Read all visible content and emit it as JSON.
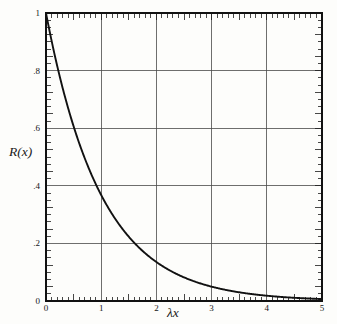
{
  "figure": {
    "name": "reliability-exponential-decay-plot",
    "background_color": "#fdfdfb",
    "line_color": "#111111",
    "grid_color": "#4a4a4a",
    "axis_color": "#111111"
  },
  "chart_data": {
    "type": "line",
    "title": "",
    "subtitle": "",
    "xlabel": "λx",
    "ylabel": "R(x)",
    "xlim": [
      0,
      5
    ],
    "ylim": [
      0,
      1
    ],
    "grid": true,
    "legend": null,
    "x_ticks": [
      0,
      1,
      2,
      3,
      4,
      5
    ],
    "x_tick_labels": [
      "0",
      "1",
      "2",
      "3",
      "4",
      "5"
    ],
    "y_ticks": [
      0,
      0.2,
      0.4,
      0.6,
      0.8,
      1
    ],
    "y_tick_labels": [
      "0",
      ".2",
      ".4",
      ".6",
      ".8",
      "1"
    ],
    "x_minor_tick_step": 0.1,
    "y_minor_tick_step": 0.025,
    "series": [
      {
        "name": "R(x) = e^(-λx)",
        "formula": "exp(-x)",
        "x": [
          0,
          0.1,
          0.2,
          0.3,
          0.4,
          0.5,
          0.6,
          0.7,
          0.8,
          0.9,
          1,
          1.1,
          1.2,
          1.3,
          1.4,
          1.5,
          1.6,
          1.7,
          1.8,
          1.9,
          2,
          2.2,
          2.4,
          2.6,
          2.8,
          3,
          3.2,
          3.4,
          3.6,
          3.8,
          4,
          4.2,
          4.4,
          4.6,
          4.8,
          5
        ],
        "values": [
          1.0,
          0.905,
          0.819,
          0.741,
          0.67,
          0.607,
          0.549,
          0.497,
          0.449,
          0.407,
          0.368,
          0.333,
          0.301,
          0.273,
          0.247,
          0.223,
          0.202,
          0.183,
          0.165,
          0.15,
          0.135,
          0.111,
          0.091,
          0.074,
          0.061,
          0.05,
          0.041,
          0.033,
          0.027,
          0.022,
          0.018,
          0.015,
          0.012,
          0.01,
          0.008,
          0.007
        ]
      }
    ],
    "annotations": []
  },
  "axes": {
    "y_title": "R(x)",
    "x_title": "λx"
  }
}
